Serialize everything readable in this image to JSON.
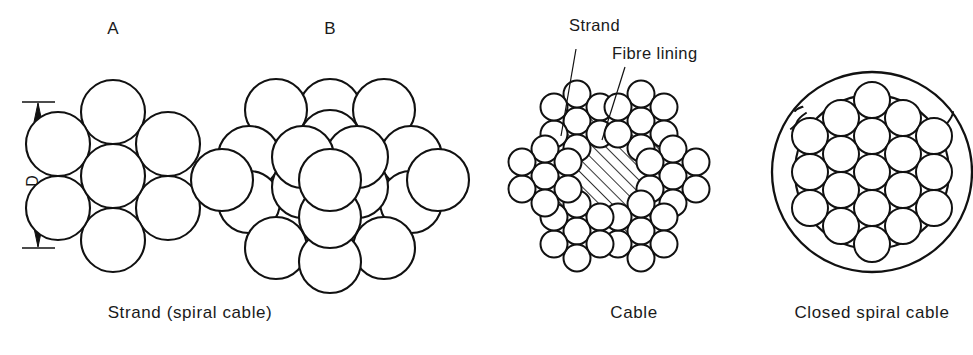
{
  "figure": {
    "background_color": "#ffffff",
    "line_color": "#111111",
    "fill_color": "#ffffff"
  },
  "panels": [
    {
      "key": "strand_a",
      "marker": "A",
      "caption": "Strand  (spiral cable)",
      "wire_count": 7,
      "arrangement": "1 + 6",
      "dimension": {
        "label": "D",
        "orientation": "vertical",
        "arrow_style": "double-headed"
      }
    },
    {
      "key": "strand_b",
      "marker": "B",
      "caption": "",
      "wire_count": 19,
      "arrangement": "1 + 6 + 12"
    },
    {
      "key": "cable",
      "marker": "",
      "caption": "Cable",
      "strand_count": 6,
      "wires_per_strand": 7,
      "core": "fibre",
      "annotations": [
        {
          "id": "strand",
          "text": "Strand"
        },
        {
          "id": "fibre_lining",
          "text": "Fibre  lining"
        }
      ]
    },
    {
      "key": "closed_spiral",
      "marker": "",
      "caption": "Closed  spiral  cable",
      "outer_layer": "interlocking Z-shaped wires",
      "inner_wire_count": 19
    }
  ],
  "captions": {
    "strand_a": "Strand  (spiral cable)",
    "cable": "Cable",
    "closed_spiral": "Closed  spiral  cable"
  },
  "markers": {
    "a": "A",
    "b": "B"
  },
  "annotations": {
    "strand": "Strand",
    "fibre_lining": "Fibre  lining",
    "diameter": "D"
  }
}
